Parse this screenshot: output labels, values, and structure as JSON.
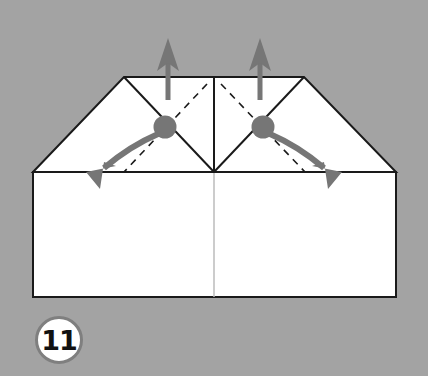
{
  "step": {
    "number": "11",
    "badge_colors": {
      "fill": "#ffffff",
      "border": "#7f7f7f",
      "text": "#111111"
    }
  },
  "colors": {
    "background": "#a3a3a3",
    "paper": "#ffffff",
    "outline": "#1a1a1a",
    "arrow": "#767676",
    "center_line": "#bbbbbb"
  },
  "diagram": {
    "arrows": [
      {
        "name": "left-up-arrow",
        "direction": "up"
      },
      {
        "name": "right-up-arrow",
        "direction": "up"
      },
      {
        "name": "left-outward-arrow",
        "direction": "down-left"
      },
      {
        "name": "right-outward-arrow",
        "direction": "down-right"
      }
    ],
    "fold_lines": [
      "left-dashed-fold",
      "right-dashed-fold"
    ],
    "pivot_points": [
      "left-pivot",
      "right-pivot"
    ]
  }
}
